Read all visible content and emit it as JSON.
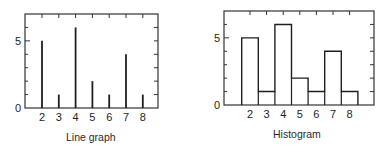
{
  "chart_data": [
    {
      "type": "bar",
      "style": "line-graph (vertical spikes)",
      "title": "Line graph",
      "categories": [
        "2",
        "3",
        "4",
        "5",
        "6",
        "7",
        "8"
      ],
      "values": [
        5,
        1,
        6,
        2,
        1,
        4,
        1
      ],
      "xlabel": "",
      "ylabel": "",
      "y_tick_labels": [
        "0",
        "5"
      ],
      "ylim": [
        0,
        7
      ],
      "grid": false,
      "legend": null
    },
    {
      "type": "bar",
      "style": "histogram (contiguous bars)",
      "title": "Histogram",
      "categories": [
        "2",
        "3",
        "4",
        "5",
        "6",
        "7",
        "8"
      ],
      "values": [
        5,
        1,
        6,
        2,
        1,
        4,
        1
      ],
      "xlabel": "",
      "ylabel": "",
      "y_tick_labels": [
        "0",
        "5"
      ],
      "ylim": [
        0,
        7
      ],
      "grid": false,
      "legend": null
    }
  ],
  "captions": {
    "left": "Line graph",
    "right": "Histogram"
  },
  "colors": {
    "ink": "#1e1e1e",
    "frame": "#333333",
    "background": "#ffffff"
  }
}
